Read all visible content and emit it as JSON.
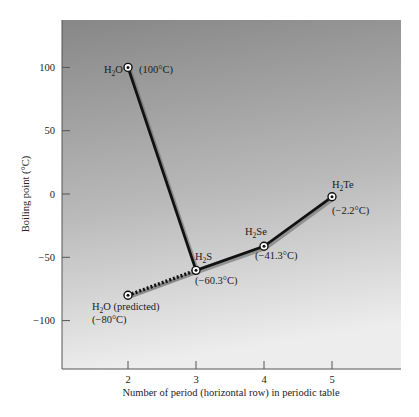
{
  "chart_data": {
    "type": "line",
    "title": "",
    "xlabel": "Number of period (horizontal row) in periodic table",
    "ylabel": "Boiling point (°C)",
    "xlim": [
      1.03,
      5.99
    ],
    "ylim": [
      -138,
      137
    ],
    "x_ticks": [
      2,
      3,
      4,
      5
    ],
    "y_ticks": [
      100,
      50,
      0,
      -50,
      -100
    ],
    "y_tick_labels": [
      "100",
      "50",
      "0",
      "−50",
      "−100"
    ],
    "grid": false,
    "legend": null,
    "series": [
      {
        "name": "Actual boiling points",
        "style": "solid",
        "points": [
          {
            "x": 2,
            "y": 100,
            "compound": "H2O",
            "value_label": "(100°C)"
          },
          {
            "x": 3,
            "y": -60.3,
            "compound": "H2S",
            "value_label": "(−60.3°C)"
          },
          {
            "x": 4,
            "y": -41.3,
            "compound": "H2Se",
            "value_label": "(−41.3°C)"
          },
          {
            "x": 5,
            "y": -2.2,
            "compound": "H2Te",
            "value_label": "(−2.2°C)"
          }
        ]
      },
      {
        "name": "Predicted H2O",
        "style": "dotted",
        "points": [
          {
            "x": 2,
            "y": -80,
            "compound": "H2O (predicted)",
            "value_label": "(−80°C)"
          },
          {
            "x": 3,
            "y": -60.3,
            "compound": "H2S",
            "value_label": ""
          }
        ]
      }
    ],
    "annotations": [
      {
        "text_main": "H",
        "sub": "2",
        "text_rest": "O",
        "extra": "",
        "value": "(100°C)"
      },
      {
        "text_main": "H",
        "sub": "2",
        "text_rest": "S",
        "extra": "",
        "value": "(−60.3°C)"
      },
      {
        "text_main": "H",
        "sub": "2",
        "text_rest": "Se",
        "extra": "",
        "value": "(−41.3°C)"
      },
      {
        "text_main": "H",
        "sub": "2",
        "text_rest": "Te",
        "extra": "",
        "value": "(−2.2°C)"
      },
      {
        "text_main": "H",
        "sub": "2",
        "text_rest": "O",
        "extra": " (predicted)",
        "value": "(−80°C)"
      }
    ],
    "colors": {
      "background_top": "#878787",
      "background_bottom": "#ececec",
      "line": "#111111",
      "shadow": "#6b6b6b",
      "marker_fill": "#ffffff"
    }
  }
}
